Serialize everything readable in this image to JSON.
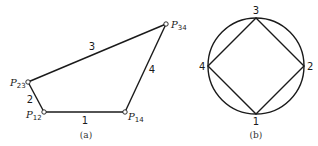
{
  "figure_a": {
    "caption": "(a)",
    "pivots": [
      {
        "id": "P12",
        "label": "P",
        "sub": "12"
      },
      {
        "id": "P23",
        "label": "P",
        "sub": "23"
      },
      {
        "id": "P34",
        "label": "P",
        "sub": "34"
      },
      {
        "id": "P14",
        "label": "P",
        "sub": "14"
      }
    ],
    "links": [
      {
        "label": "1",
        "from": "P12",
        "to": "P14"
      },
      {
        "label": "2",
        "from": "P12",
        "to": "P23"
      },
      {
        "label": "3",
        "from": "P23",
        "to": "P34"
      },
      {
        "label": "4",
        "from": "P34",
        "to": "P14"
      }
    ]
  },
  "figure_b": {
    "caption": "(b)",
    "vertices": [
      {
        "label": "3",
        "position": "top"
      },
      {
        "label": "2",
        "position": "right"
      },
      {
        "label": "1",
        "position": "bottom"
      },
      {
        "label": "4",
        "position": "left"
      }
    ]
  }
}
